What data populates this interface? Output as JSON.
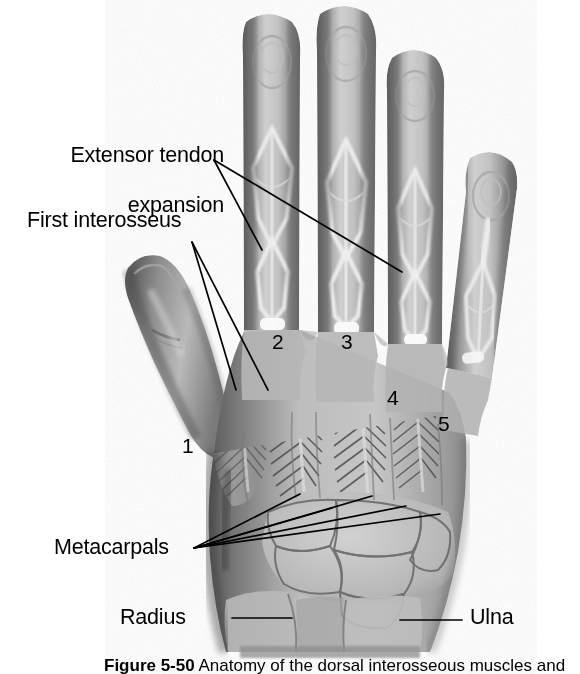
{
  "figure": {
    "type": "anatomical-illustration",
    "background_color": "#ffffff",
    "ink_color": "#000000"
  },
  "labels": {
    "extensor_tendon_expansion": {
      "line1": "Extensor tendon",
      "line2": "expansion"
    },
    "first_interosseus": "First interosseus",
    "metacarpals": "Metacarpals",
    "radius": "Radius",
    "ulna": "Ulna"
  },
  "numbered_markers": [
    {
      "id": "1",
      "text": "1"
    },
    {
      "id": "2",
      "text": "2"
    },
    {
      "id": "3",
      "text": "3"
    },
    {
      "id": "4",
      "text": "4"
    },
    {
      "id": "5",
      "text": "5"
    }
  ],
  "caption": {
    "figure_number": "Figure 5-50",
    "separator": "   ",
    "text": "Anatomy of the dorsal interosseous muscles and"
  }
}
